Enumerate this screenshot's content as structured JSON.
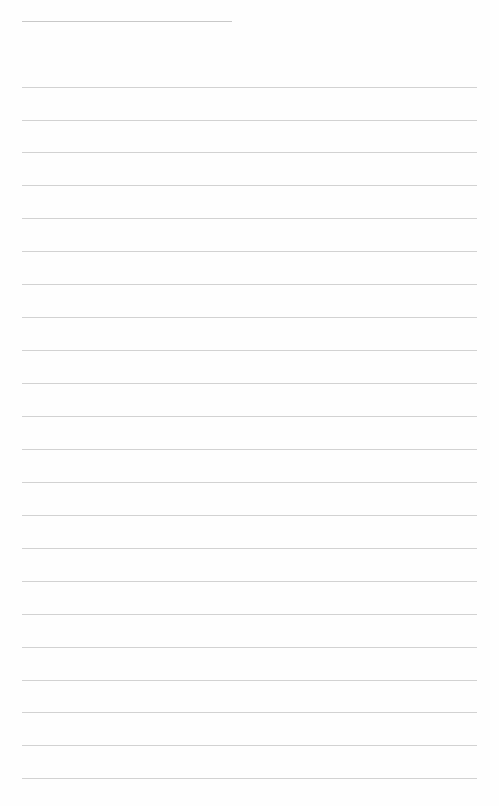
{
  "page": {
    "type": "lined-paper",
    "title_line": {
      "x": 22,
      "y": 21,
      "width": 210
    },
    "rule_color": "#d2d2d2",
    "rules_y": [
      87,
      120,
      152,
      185,
      218,
      251,
      284,
      317,
      350,
      383,
      416,
      449,
      482,
      515,
      548,
      581,
      614,
      647,
      680,
      712,
      745,
      778
    ]
  }
}
